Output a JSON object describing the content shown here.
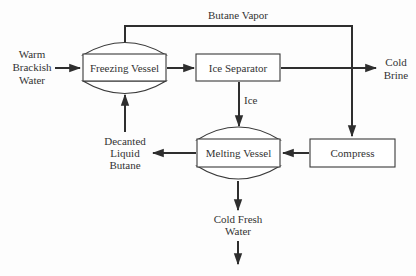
{
  "diagram": {
    "type": "process-flow",
    "title": "",
    "colors": {
      "line": "#2e2e2e",
      "text": "#333333",
      "background": "#fdfdfd"
    },
    "nodes": [
      {
        "id": "freezing_vessel",
        "label": "Freezing Vessel",
        "shape": "vessel"
      },
      {
        "id": "ice_separator",
        "label": "Ice Separator",
        "shape": "box"
      },
      {
        "id": "melting_vessel",
        "label": "Melting Vessel",
        "shape": "vessel"
      },
      {
        "id": "compress",
        "label": "Compress",
        "shape": "box"
      }
    ],
    "terminals": {
      "warm_brackish_water": [
        "Warm",
        "Brackish",
        "Water"
      ],
      "cold_brine": [
        "Cold",
        "Brine"
      ],
      "decanted_liquid_butane": [
        "Decanted",
        "Liquid",
        "Butane"
      ],
      "cold_fresh_water": [
        "Cold Fresh",
        "Water"
      ]
    },
    "edge_labels": {
      "butane_vapor": "Butane Vapor",
      "ice": "Ice"
    },
    "edges": [
      {
        "from": "warm_brackish_water",
        "to": "freezing_vessel"
      },
      {
        "from": "freezing_vessel",
        "to": "ice_separator"
      },
      {
        "from": "ice_separator",
        "to": "cold_brine"
      },
      {
        "from": "ice_separator",
        "to": "melting_vessel",
        "label": "Ice"
      },
      {
        "from": "freezing_vessel",
        "to": "compress",
        "label": "Butane Vapor"
      },
      {
        "from": "compress",
        "to": "melting_vessel"
      },
      {
        "from": "melting_vessel",
        "to": "decanted_liquid_butane"
      },
      {
        "from": "decanted_liquid_butane",
        "to": "freezing_vessel"
      },
      {
        "from": "melting_vessel",
        "to": "cold_fresh_water"
      }
    ]
  }
}
